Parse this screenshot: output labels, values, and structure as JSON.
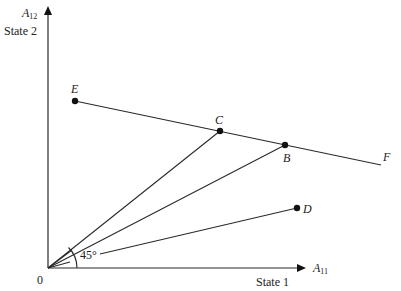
{
  "axes": {
    "y_label_main": "A",
    "y_label_sub": "12",
    "y_caption": "State 2",
    "x_label_main": "A",
    "x_label_sub": "11",
    "x_caption": "State 1",
    "origin_label": "0"
  },
  "angle_label": "45°",
  "points": {
    "E": {
      "label": "E",
      "x": 75,
      "y": 101
    },
    "C": {
      "label": "C",
      "x": 220,
      "y": 131
    },
    "B": {
      "label": "B",
      "x": 285,
      "y": 145
    },
    "D": {
      "label": "D",
      "x": 297,
      "y": 208
    },
    "F": {
      "label": "F"
    }
  },
  "colors": {
    "line": "#2a2a2a",
    "text": "#222222",
    "background": "#ffffff"
  }
}
